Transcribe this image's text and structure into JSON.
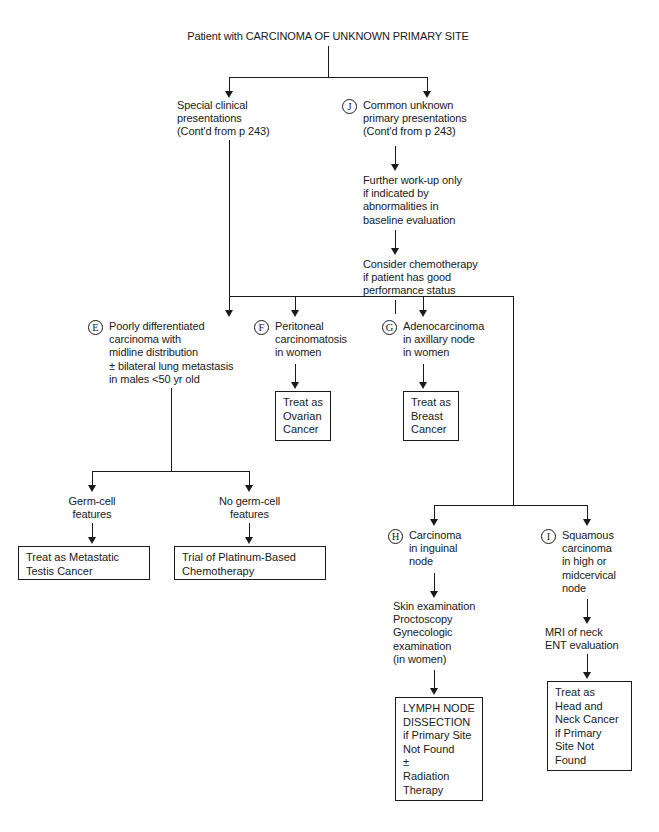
{
  "diagram": {
    "title": "Patient with CARCINOMA OF UNKNOWN PRIMARY SITE",
    "ink_color": "#1a1a1a",
    "background": "#ffffff"
  },
  "nodes": {
    "root": "Patient with CARCINOMA OF UNKNOWN PRIMARY SITE",
    "special_clinical": "Special clinical\npresentations\n(Cont'd from p 243)",
    "common_unknown": "Common unknown\nprimary presentations\n(Cont'd from p 243)",
    "further_workup": "Further work-up only\nif indicated by\nabnormalities in\nbaseline evaluation",
    "consider_chemo": "Consider chemotherapy\nif patient has good\nperformance status",
    "poorly_diff": "Poorly differentiated\ncarcinoma with\nmidline distribution\n± bilateral lung metastasis\nin males <50 yr old",
    "peritoneal": "Peritoneal\ncarcinomatosis\nin women",
    "adeno_axillary": "Adenocarcinoma\nin axillary node\nin women",
    "treat_ovarian": "Treat as\nOvarian\nCancer",
    "treat_breast": "Treat as\nBreast\nCancer",
    "germ_cell": "Germ-cell\nfeatures",
    "no_germ_cell": "No germ-cell\nfeatures",
    "treat_testis": "Treat as Metastatic\nTestis Cancer",
    "trial_platinum": "Trial of Platinum-Based\nChemotherapy",
    "inguinal": "Carcinoma\nin inguinal\nnode",
    "squamous": "Squamous\ncarcinoma\nin high or\nmidcervical\nnode",
    "skin_exam": "Skin examination\nProctoscopy\nGynecologic\n    examination\n    (in women)",
    "mri_neck": "MRI of neck\nENT evaluation",
    "lymph_dissection": "LYMPH NODE\nDISSECTION\nif Primary Site\nNot Found\n±\nRadiation\nTherapy",
    "treat_head_neck": "Treat as\nHead and\nNeck Cancer\nif Primary\nSite Not\nFound"
  },
  "markers": {
    "e": "E",
    "f": "F",
    "g": "G",
    "h": "H",
    "i": "I",
    "j": "J"
  }
}
